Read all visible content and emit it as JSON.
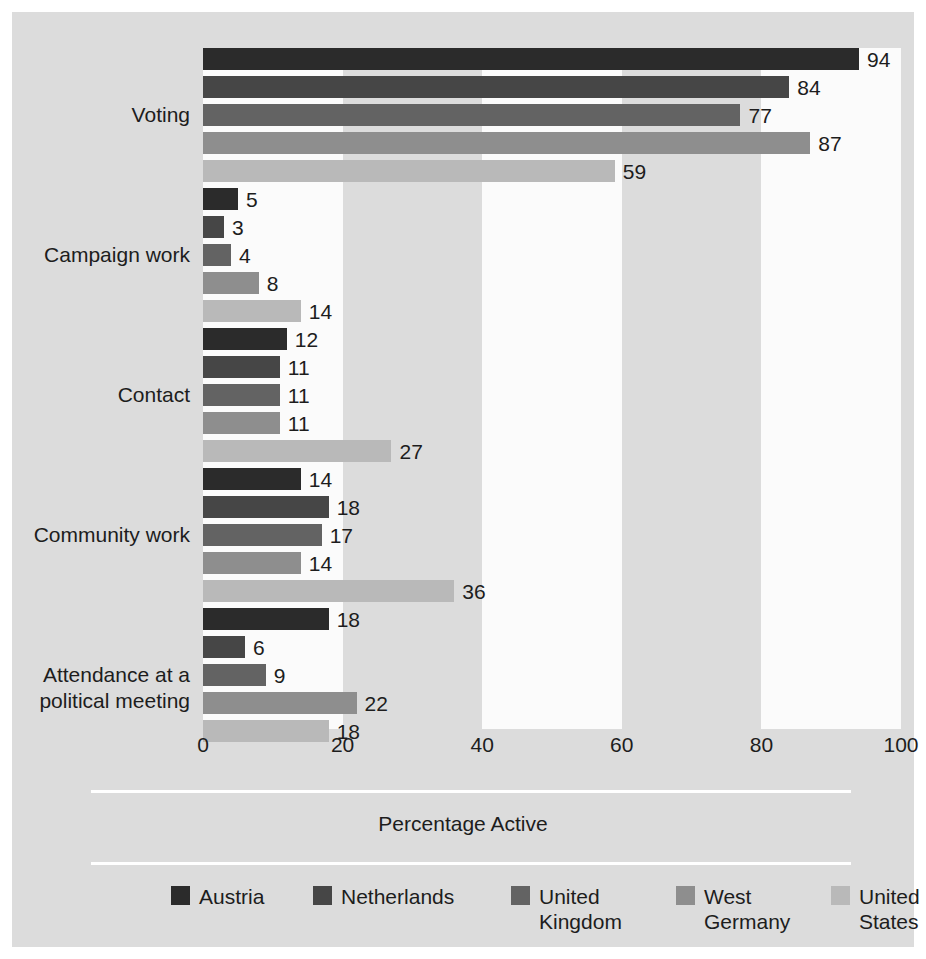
{
  "chart_data": {
    "type": "bar",
    "orientation": "horizontal",
    "title": "",
    "xlabel": "Percentage Active",
    "ylabel": "",
    "xlim": [
      0,
      100
    ],
    "xticks": [
      "0",
      "20",
      "40",
      "60",
      "80",
      "100"
    ],
    "grid": false,
    "legend_position": "bottom",
    "categories": [
      "Voting",
      "Campaign work",
      "Contact",
      "Community work",
      "Attendance at a\npolitical meeting"
    ],
    "series": [
      {
        "name": "Austria",
        "color": "#2b2b2b",
        "values": [
          94,
          5,
          12,
          14,
          18
        ]
      },
      {
        "name": "Netherlands",
        "color": "#464646",
        "values": [
          84,
          3,
          11,
          18,
          6
        ]
      },
      {
        "name": "United\nKingdom",
        "color": "#636363",
        "values": [
          77,
          4,
          11,
          17,
          9
        ]
      },
      {
        "name": "West\nGermany",
        "color": "#8e8e8e",
        "values": [
          87,
          8,
          11,
          14,
          22
        ]
      },
      {
        "name": "United\nStates",
        "color": "#b9b9b9",
        "values": [
          59,
          14,
          27,
          36,
          18
        ]
      }
    ]
  },
  "figure": {
    "background": "#dcdcdc",
    "band_color": "#fbfbfb",
    "bands": [
      [
        0,
        20
      ],
      [
        40,
        60
      ],
      [
        80,
        100
      ]
    ]
  }
}
